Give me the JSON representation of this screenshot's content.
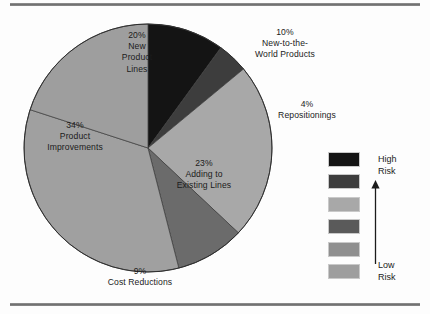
{
  "figure": {
    "background": "#fdfdfd",
    "rule_color": "#6f6f6f"
  },
  "chart_data": {
    "type": "pie",
    "title": "",
    "subtitle": "",
    "xlabel": "",
    "ylabel": "",
    "legend_position": "right",
    "grid": false,
    "total": 100,
    "units": "percent",
    "start_angle_deg": 0,
    "direction": "clockwise",
    "categories": [
      "New-to-the-World Products",
      "Repositionings",
      "Adding to Existing Lines",
      "Cost Reductions",
      "Product Improvements",
      "New Product Lines"
    ],
    "values": [
      10,
      4,
      23,
      9,
      34,
      20
    ],
    "colors": [
      "#141414",
      "#3d3d3d",
      "#a8a8a8",
      "#6b6b6b",
      "#a0a0a0",
      "#9e9e9e"
    ],
    "slices": [
      {
        "label": "New-to-the-World Products",
        "value": 10,
        "percent_text": "10%",
        "color": "#141414",
        "label_lines": [
          "10%",
          "New-to-the-",
          "World Products"
        ],
        "label_placement": "outside-right"
      },
      {
        "label": "Repositionings",
        "value": 4,
        "percent_text": "4%",
        "color": "#3d3d3d",
        "label_lines": [
          "4%",
          "Repositionings"
        ],
        "label_placement": "outside-right"
      },
      {
        "label": "Adding to Existing Lines",
        "value": 23,
        "percent_text": "23%",
        "color": "#a8a8a8",
        "label_lines": [
          "23%",
          "Adding to",
          "Existing Lines"
        ],
        "label_placement": "inside"
      },
      {
        "label": "Cost Reductions",
        "value": 9,
        "percent_text": "9%",
        "color": "#6b6b6b",
        "label_lines": [
          "9%",
          "Cost Reductions"
        ],
        "label_placement": "outside-bottom"
      },
      {
        "label": "Product Improvements",
        "value": 34,
        "percent_text": "34%",
        "color": "#a0a0a0",
        "label_lines": [
          "34%",
          "Product",
          "Improvements"
        ],
        "label_placement": "inside"
      },
      {
        "label": "New Product Lines",
        "value": 20,
        "percent_text": "20%",
        "color": "#9e9e9e",
        "label_lines": [
          "20%",
          "New",
          "Product",
          "Lines"
        ],
        "label_placement": "inside"
      }
    ]
  },
  "labels": {
    "new_product_lines": "20%\nNew\nProduct\nLines",
    "new_to_the_world": "10%\nNew-to-the-\nWorld Products",
    "repositionings": "4%\nRepositionings",
    "product_improvements": "34%\nProduct\nImprovements",
    "adding_existing": "23%\nAdding to\nExisting Lines",
    "cost_reductions": "9%\nCost Reductions"
  },
  "legend": {
    "title": "",
    "high_label": "High\nRisk",
    "low_label": "Low\nRisk",
    "arrow_direction": "up",
    "arrow_meaning": "increasing risk",
    "swatches": [
      {
        "color": "#141414",
        "risk": "High Risk"
      },
      {
        "color": "#3d3d3d",
        "risk": ""
      },
      {
        "color": "#a8a8a8",
        "risk": ""
      },
      {
        "color": "#5a5a5a",
        "risk": ""
      },
      {
        "color": "#8f8f8f",
        "risk": ""
      },
      {
        "color": "#9e9e9e",
        "risk": "Low Risk"
      }
    ]
  }
}
